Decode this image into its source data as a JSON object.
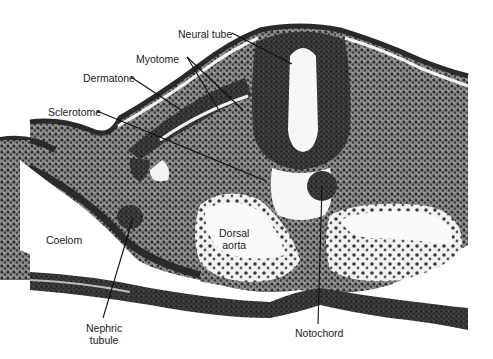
{
  "figure": {
    "type": "histology-micrograph",
    "labels": [
      {
        "id": "neural-tube",
        "text": "Neural tube",
        "x": 178,
        "y": 28
      },
      {
        "id": "myotome",
        "text": "Myotome",
        "x": 136,
        "y": 53
      },
      {
        "id": "dermatone",
        "text": "Dermatone",
        "x": 83,
        "y": 72
      },
      {
        "id": "sclerotome",
        "text": "Sclerotome",
        "x": 48,
        "y": 106
      },
      {
        "id": "coelom",
        "text": "Coelom",
        "x": 46,
        "y": 234
      },
      {
        "id": "dorsal-aorta",
        "text": "Dorsal\naorta",
        "x": 219,
        "y": 227
      },
      {
        "id": "nephric-tubule",
        "text": "Nephric\ntubule",
        "x": 86,
        "y": 322
      },
      {
        "id": "notochord",
        "text": "Notochord",
        "x": 295,
        "y": 327
      }
    ]
  },
  "colors": {
    "tissue_dark": "#2a2a2a",
    "tissue_mid": "#5a5a5a",
    "tissue_light": "#9a9a9a",
    "lumen": "#f6f6f6",
    "background": "#ffffff",
    "leader_line": "#111111"
  }
}
